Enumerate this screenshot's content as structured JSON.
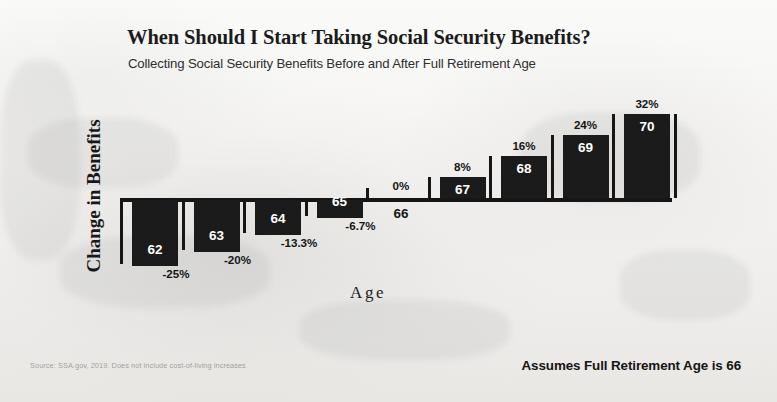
{
  "chart_data": {
    "type": "bar",
    "title": "When Should I Start Taking Social Security Benefits?",
    "subtitle": "Collecting Social Security Benefits Before and After Full Retirement Age",
    "xlabel": "Age",
    "ylabel": "Change in Benefits",
    "categories": [
      "62",
      "63",
      "64",
      "65",
      "66",
      "67",
      "68",
      "69",
      "70"
    ],
    "values": [
      -25,
      -20,
      -13.3,
      -6.7,
      0,
      8,
      16,
      24,
      32
    ],
    "value_labels": [
      "-25%",
      "-20%",
      "-13.3%",
      "-6.7%",
      "0%",
      "8%",
      "16%",
      "24%",
      "32%"
    ],
    "ylim": [
      -25,
      32
    ],
    "grid": false,
    "legend": null,
    "baseline": 0,
    "bars": [
      {
        "age": "62",
        "value": -25,
        "label": "-25%",
        "age_label_inside": true
      },
      {
        "age": "63",
        "value": -20,
        "label": "-20%",
        "age_label_inside": true
      },
      {
        "age": "64",
        "value": -13.3,
        "label": "-13.3%",
        "age_label_inside": true
      },
      {
        "age": "65",
        "value": -6.7,
        "label": "-6.7%",
        "age_label_inside": true
      },
      {
        "age": "66",
        "value": 0,
        "label": "0%",
        "age_label_inside": false
      },
      {
        "age": "67",
        "value": 8,
        "label": "8%",
        "age_label_inside": true
      },
      {
        "age": "68",
        "value": 16,
        "label": "16%",
        "age_label_inside": true
      },
      {
        "age": "69",
        "value": 24,
        "label": "24%",
        "age_label_inside": true
      },
      {
        "age": "70",
        "value": 32,
        "label": "32%",
        "age_label_inside": true
      }
    ]
  },
  "notes": {
    "source": "Source: SSA.gov, 2019. Does not include cost-of-living increases",
    "assumption": "Assumes Full Retirement Age is 66"
  },
  "colors": {
    "bar": "#1a1a1a",
    "axis": "#151515",
    "text": "#141414",
    "bar_label": "#ffffff",
    "page": "#f6f5f3"
  }
}
